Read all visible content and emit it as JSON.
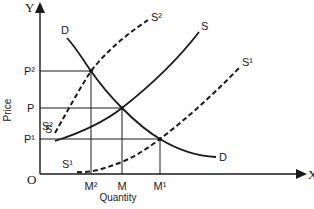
{
  "diagram": {
    "type": "supply-demand",
    "axes": {
      "y_letter": "Y",
      "x_letter": "X",
      "origin": "O",
      "y_label": "Price",
      "x_label": "Quantity"
    },
    "price_levels": [
      {
        "id": "P2",
        "label": "P²",
        "y": 71
      },
      {
        "id": "P",
        "label": "P",
        "y": 108
      },
      {
        "id": "P1",
        "label": "P¹",
        "y": 139
      }
    ],
    "quantity_levels": [
      {
        "id": "M2",
        "label": "M²",
        "x": 91
      },
      {
        "id": "M",
        "label": "M",
        "x": 122
      },
      {
        "id": "M1",
        "label": "M¹",
        "x": 160
      }
    ],
    "curves": [
      {
        "id": "D",
        "label_start": "D",
        "label_end": "D",
        "style": "solid"
      },
      {
        "id": "S",
        "label_start": "S",
        "label_end": "S",
        "style": "solid"
      },
      {
        "id": "S2",
        "label_start": "S²",
        "label_end": "S²",
        "style": "dashed"
      },
      {
        "id": "S1",
        "label_start": "S¹",
        "label_end": "S¹",
        "style": "dashed"
      }
    ],
    "equilibria": [
      {
        "curves": "D & S2",
        "price": "P²",
        "quantity": "M²"
      },
      {
        "curves": "D & S",
        "price": "P",
        "quantity": "M"
      },
      {
        "curves": "D & S1",
        "price": "P¹",
        "quantity": "M¹"
      }
    ],
    "colors": {
      "ink": "#1a1a1a",
      "background": "#ffffff"
    }
  }
}
